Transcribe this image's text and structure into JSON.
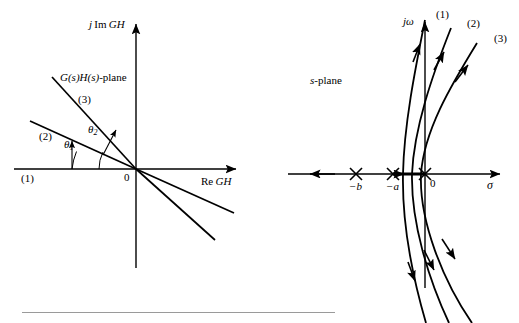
{
  "figure": {
    "background": "#ffffff",
    "stroke": "#000000",
    "rule_color": "#9a9a9a",
    "width": 519,
    "height": 323
  },
  "left_panel": {
    "name": "gh-plane-polar-plot",
    "plane_label": "G(s)H(s)-plane",
    "plane_label_parts": {
      "g": "G",
      "s1": "(s)",
      "h": "H",
      "s2": "(s)",
      "suffix": "-plane"
    },
    "axis_vertical_label": "j Im GH",
    "axis_vertical_parts": {
      "j": "j",
      "im": "Im",
      "gh": "GH"
    },
    "axis_horizontal_label": "Re GH",
    "axis_horizontal_parts": {
      "re": "Re",
      "gh": "GH"
    },
    "origin_label": "0",
    "curve_labels": [
      "(1)",
      "(2)",
      "(3)"
    ],
    "angle_labels": [
      {
        "symbol": "θ",
        "subscript": "1",
        "name": "theta-1"
      },
      {
        "symbol": "θ",
        "subscript": "2",
        "name": "theta-2"
      }
    ],
    "rays": [
      {
        "label": "(1)",
        "angle_deg": 0,
        "description": "horizontal ray along negative real axis through origin to positive real axis"
      },
      {
        "label": "(2)",
        "angle_deg": 13,
        "description": "ray rotated by theta-1 above negative real axis"
      },
      {
        "label": "(3)",
        "angle_deg": 27,
        "description": "ray rotated by theta-2 above negative real axis"
      }
    ]
  },
  "right_panel": {
    "name": "s-plane-root-locus",
    "plane_label": "s-plane",
    "plane_label_parts": {
      "s": "s",
      "suffix": "-plane"
    },
    "axis_vertical_label": "jω",
    "axis_horizontal_label": "σ",
    "origin_label": "0",
    "pole_labels": [
      "−b",
      "−a",
      "0"
    ],
    "pole_marker": "x-marker",
    "poles": [
      {
        "label": "−b",
        "x": 356,
        "y": 174
      },
      {
        "label": "−a",
        "x": 393,
        "y": 174
      },
      {
        "label": "0",
        "x": 425,
        "y": 174
      }
    ],
    "branch_labels": [
      "(1)",
      "(2)",
      "(3)"
    ],
    "branches": [
      {
        "label": "(1)",
        "description": "innermost root-locus branch departing upward and downward, crossing jw axis"
      },
      {
        "label": "(2)",
        "description": "middle root-locus branch"
      },
      {
        "label": "(3)",
        "description": "outermost root-locus branch"
      }
    ],
    "arrow_directions": {
      "upper": "up-right",
      "lower": "down-right",
      "real_axis": "left"
    }
  },
  "footer": {
    "rule_present": true
  }
}
